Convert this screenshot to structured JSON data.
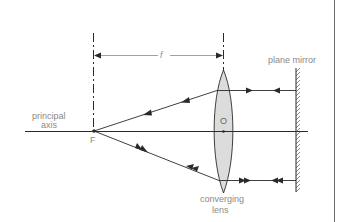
{
  "diagram": {
    "labels": {
      "focal_length": "f",
      "plane_mirror": "plane mirror",
      "principal_axis_line1": "principal",
      "principal_axis_line2": "axis",
      "focal_point": "F",
      "optical_centre": "O",
      "lens_line1": "converging",
      "lens_line2": "lens"
    },
    "colors": {
      "line": "#2a2a2a",
      "label": "#8a8a8a",
      "lens_fill": "#dcdcdc",
      "frame": "#6d6d6d"
    },
    "geometry": {
      "principal_axis_y": 131,
      "focal_point_x": 94,
      "lens_x": 223,
      "mirror_x": 296,
      "upper_ray_y": 90,
      "lower_ray_y": 180
    }
  }
}
